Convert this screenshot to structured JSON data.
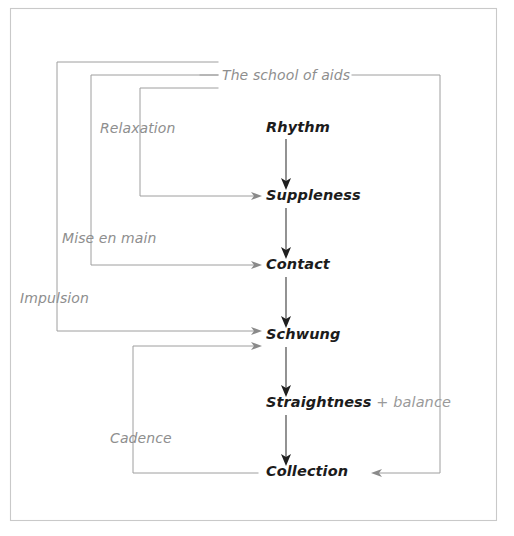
{
  "diagram": {
    "title": "The school of aids",
    "theme": {
      "background": "#ffffff",
      "frame_stroke": "#c9c9c9",
      "connector_gray": "#9e9e9e",
      "connector_dark": "#3a3a3a",
      "node_text": "#1c1c1c",
      "aid_text": "#8e8e8e",
      "suffix_text": "#9a9a9a"
    },
    "frame": {
      "x": 10,
      "y": 8,
      "width": 487,
      "height": 513
    },
    "nodes": [
      {
        "id": "rhythm",
        "label": "Rhythm",
        "suffix": "",
        "x": 266,
        "y": 132
      },
      {
        "id": "suppleness",
        "label": "Suppleness",
        "suffix": "",
        "x": 266,
        "y": 200
      },
      {
        "id": "contact",
        "label": "Contact",
        "suffix": "",
        "x": 266,
        "y": 269
      },
      {
        "id": "schwung",
        "label": "Schwung",
        "suffix": "",
        "x": 266,
        "y": 339
      },
      {
        "id": "straightness",
        "label": "Straightness",
        "suffix": " + balance",
        "x": 266,
        "y": 407
      },
      {
        "id": "collection",
        "label": "Collection",
        "suffix": "",
        "x": 266,
        "y": 476
      }
    ],
    "aids": [
      {
        "id": "school-of-aids",
        "label": "The school of aids",
        "x": 222,
        "y": 80,
        "bracket": "outer-top"
      },
      {
        "id": "relaxation",
        "label": "Relaxation",
        "x": 100,
        "y": 133,
        "bracket": "relaxation"
      },
      {
        "id": "mise-en-main",
        "label": "Mise en main",
        "x": 62,
        "y": 243,
        "bracket": "mise-en-main"
      },
      {
        "id": "impulsion",
        "label": "Impulsion",
        "x": 20,
        "y": 303,
        "bracket": "impulsion"
      },
      {
        "id": "cadence",
        "label": "Cadence",
        "x": 110,
        "y": 443,
        "bracket": "cadence"
      }
    ],
    "vertical_flow": [
      {
        "from": "rhythm",
        "to": "suppleness",
        "x": 286,
        "y1": 139,
        "y2": 188
      },
      {
        "from": "suppleness",
        "to": "contact",
        "x": 286,
        "y1": 208,
        "y2": 257
      },
      {
        "from": "contact",
        "to": "schwung",
        "x": 286,
        "y1": 277,
        "y2": 327
      },
      {
        "from": "schwung",
        "to": "straightness",
        "x": 286,
        "y1": 347,
        "y2": 395
      },
      {
        "from": "straightness",
        "to": "collection",
        "x": 286,
        "y1": 415,
        "y2": 464
      }
    ],
    "brackets": [
      {
        "id": "impulsion-bracket",
        "to": "schwung",
        "corner_x": 57,
        "top_y": 62,
        "arrow_y": 331,
        "arrow_x": 262
      },
      {
        "id": "mise-bracket",
        "to": "contact",
        "corner_x": 91,
        "top_y": 75,
        "arrow_y": 265,
        "arrow_x": 262
      },
      {
        "id": "relaxation-bracket",
        "to": "suppleness",
        "corner_x": 140,
        "top_y": 88,
        "arrow_y": 196,
        "arrow_x": 262
      },
      {
        "id": "cadence-bracket",
        "to": "schwung",
        "corner_x": 133,
        "top_y": 346,
        "arrow_y": 346,
        "arrow_x": 262,
        "bottom_y": 473
      },
      {
        "id": "return-bracket",
        "to": "collection",
        "corner_x": 440,
        "top_y": 75,
        "arrow_y": 473,
        "arrow_x": 378
      }
    ],
    "title_rule": {
      "left_x1": 200,
      "left_x2": 218,
      "right_x1": 352,
      "right_x2": 440,
      "y": 75
    }
  }
}
